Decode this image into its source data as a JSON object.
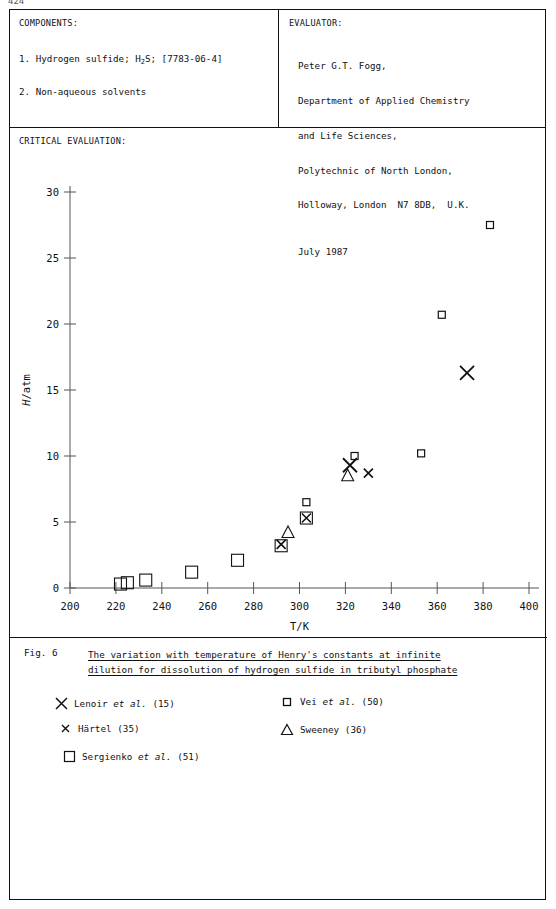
{
  "page": {
    "page_number": "424"
  },
  "header": {
    "components_label": "COMPONENTS:",
    "components": [
      {
        "index": "1.",
        "name": "Hydrogen sulfide;",
        "formula_pre": "H",
        "formula_sub": "2",
        "formula_post": "S;",
        "registry": "[7783-06-4]"
      },
      {
        "index": "2.",
        "name": "Non-aqueous solvents",
        "formula_pre": "",
        "formula_sub": "",
        "formula_post": "",
        "registry": ""
      }
    ],
    "evaluator_label": "EVALUATOR:",
    "evaluator_lines": [
      "Peter G.T. Fogg,",
      "Department of Applied Chemistry",
      "and Life Sciences,",
      "Polytechnic of North London,",
      "Holloway, London  N7 8DB,  U.K."
    ],
    "evaluator_date": "July 1987"
  },
  "critical_evaluation_label": "CRITICAL EVALUATION:",
  "chart_data": {
    "type": "scatter",
    "title": "",
    "xlabel": "T/K",
    "ylabel": "H/atm",
    "ylabel_italic_part": "H",
    "ylabel_rest": "/atm",
    "xlim": [
      200,
      400
    ],
    "ylim": [
      0,
      30
    ],
    "xticks": [
      200,
      220,
      240,
      260,
      280,
      300,
      320,
      340,
      360,
      380,
      400
    ],
    "yticks": [
      0,
      5,
      10,
      15,
      20,
      25,
      30
    ],
    "xtick_labels": [
      "200",
      "220",
      "240",
      "260",
      "280",
      "300",
      "320",
      "340",
      "360",
      "380",
      "400"
    ],
    "ytick_labels": [
      "0",
      "5",
      "10",
      "15",
      "20",
      "25",
      "30"
    ],
    "grid": false,
    "legend_position": "below-plot",
    "series": [
      {
        "name": "Lenoir et al. (15)",
        "marker": "big-x",
        "ref": "(15)",
        "points": [
          {
            "x": 322,
            "y": 9.3
          },
          {
            "x": 373,
            "y": 16.3
          }
        ]
      },
      {
        "name": "Härtel (35)",
        "marker": "small-x",
        "ref": "(35)",
        "points": [
          {
            "x": 292,
            "y": 3.3
          },
          {
            "x": 303,
            "y": 5.3
          },
          {
            "x": 330,
            "y": 8.7
          }
        ]
      },
      {
        "name": "Sergienko et al. (51)",
        "marker": "big-square",
        "ref": "(51)",
        "points": [
          {
            "x": 222,
            "y": 0.3
          },
          {
            "x": 225,
            "y": 0.4
          },
          {
            "x": 233,
            "y": 0.6
          },
          {
            "x": 253,
            "y": 1.2
          },
          {
            "x": 273,
            "y": 2.1
          },
          {
            "x": 292,
            "y": 3.2
          },
          {
            "x": 303,
            "y": 5.3
          }
        ]
      },
      {
        "name": "Vei et al. (50)",
        "marker": "small-square",
        "ref": "(50)",
        "points": [
          {
            "x": 303,
            "y": 6.5
          },
          {
            "x": 324,
            "y": 10.0
          },
          {
            "x": 353,
            "y": 10.2
          },
          {
            "x": 362,
            "y": 20.7
          },
          {
            "x": 383,
            "y": 27.5
          }
        ]
      },
      {
        "name": "Sweeney (36)",
        "marker": "triangle",
        "ref": "(36)",
        "points": [
          {
            "x": 295,
            "y": 4.2
          },
          {
            "x": 321,
            "y": 8.5
          }
        ]
      }
    ]
  },
  "caption": {
    "fig_label": "Fig. 6",
    "line1": "The variation with temperature of Henry's constants at infinite",
    "line2": "dilution for dissolution of hydrogen sulfide in tributyl phosphate"
  },
  "legend": {
    "entries": [
      {
        "marker": "big-x",
        "pre": "Lenoir ",
        "italic": "et al.",
        "post": " (15)",
        "col": 0,
        "row": 0
      },
      {
        "marker": "small-x",
        "pre": "Härtel",
        "italic": "",
        "post": " (35)",
        "col": 0,
        "row": 1
      },
      {
        "marker": "big-square",
        "pre": "Sergienko ",
        "italic": "et al.",
        "post": " (51)",
        "col": 0,
        "row": 2
      },
      {
        "marker": "small-square",
        "pre": "Vei ",
        "italic": "et al.",
        "post": " (50)",
        "col": 1,
        "row": 0
      },
      {
        "marker": "triangle",
        "pre": "Sweeney",
        "italic": "",
        "post": " (36)",
        "col": 1,
        "row": 1
      }
    ]
  },
  "colors": {
    "ink": "#111111",
    "rule": "#111111",
    "axis": "#555555",
    "paper": "#ffffff"
  }
}
